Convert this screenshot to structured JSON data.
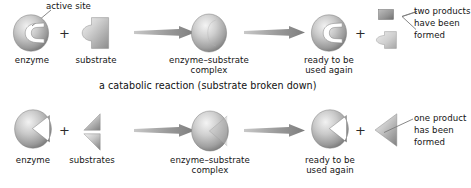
{
  "diagram": {
    "title_visible": false,
    "palette": {
      "ink": "#141414",
      "shape_dark": "#6f6f6f",
      "shape_mid": "#a8a8a8",
      "shape_light": "#e8e8e8",
      "shape_outline": "#8a8a8a",
      "arrow": "#8f8f8f",
      "leader_line": "#7a7a7a",
      "background": "#ffffff"
    },
    "rows": [
      {
        "id": "catabolic",
        "caption": "a catabolic reaction (substrate broken down)",
        "callout_top": "active site",
        "operators": [
          "+",
          "+"
        ],
        "steps": [
          {
            "id": "enzyme",
            "label": "enzyme",
            "shape": "enzyme-notched-oval"
          },
          {
            "id": "substrate",
            "label": "substrate",
            "shape": "substrate-block"
          },
          {
            "id": "complex",
            "label": "enzyme–substrate\ncomplex",
            "shape": "filled-oval"
          },
          {
            "id": "reusable-enzyme",
            "label": "ready to be\nused again",
            "shape": "enzyme-notched-oval"
          },
          {
            "id": "products",
            "label": "two products\nhave been\nformed",
            "shape": "two-products"
          }
        ]
      },
      {
        "id": "anabolic",
        "caption": "",
        "operators": [
          "+",
          "+"
        ],
        "steps": [
          {
            "id": "enzyme2",
            "label": "enzyme",
            "shape": "enzyme-wedge-oval"
          },
          {
            "id": "substrates",
            "label": "substrates",
            "shape": "two-triangles"
          },
          {
            "id": "complex2",
            "label": "enzyme–substrate\ncomplex",
            "shape": "filled-oval-wedge"
          },
          {
            "id": "reusable-enzyme2",
            "label": "ready to be\nused again",
            "shape": "enzyme-wedge-oval"
          },
          {
            "id": "product2",
            "label": "one product\nhas been\nformed",
            "shape": "one-triangle"
          }
        ]
      }
    ],
    "labels": {
      "enzyme": "enzyme",
      "substrate": "substrate",
      "substrates": "substrates",
      "complex_line1": "enzyme–substrate",
      "complex_line2": "complex",
      "ready_line1": "ready to be",
      "ready_line2": "used again",
      "active_site": "active site",
      "two_products_line1": "two products",
      "two_products_line2": "have been",
      "two_products_line3": "formed",
      "one_product_line1": "one product",
      "one_product_line2": "has been",
      "one_product_line3": "formed",
      "catabolic_caption": "a catabolic reaction (substrate broken down)",
      "plus": "+"
    }
  }
}
